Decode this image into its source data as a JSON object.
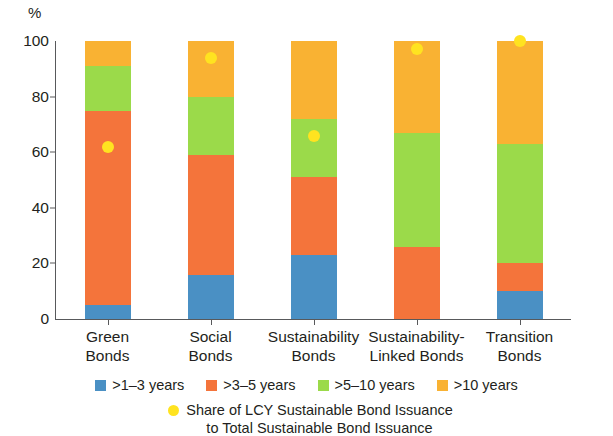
{
  "chart_data": {
    "type": "bar",
    "subtype": "stacked-bar-100-with-scatter-overlay",
    "title": "",
    "xlabel": "",
    "ylabel": "%",
    "ylim": [
      0,
      100
    ],
    "yticks": [
      0,
      20,
      40,
      60,
      80,
      100
    ],
    "ytick_labels": [
      "0",
      "20",
      "40",
      "60",
      "80",
      "100"
    ],
    "grid": false,
    "legend_position": "bottom",
    "categories": [
      "Green\nBonds",
      "Social\nBonds",
      "Sustainability\nBonds",
      "Sustainability-\nLinked Bonds",
      "Transition\nBonds"
    ],
    "category_names": [
      "Green Bonds",
      "Social Bonds",
      "Sustainability Bonds",
      "Sustainability-Linked Bonds",
      "Transition Bonds"
    ],
    "series": [
      {
        "name": ">1–3 years",
        "color": "#4a90c4",
        "values": [
          5,
          16,
          23,
          0,
          10
        ]
      },
      {
        "name": ">3–5 years",
        "color": "#f4743b",
        "values": [
          70,
          43,
          28,
          26,
          10
        ]
      },
      {
        "name": ">5–10 years",
        "color": "#9bda4a",
        "values": [
          16,
          21,
          21,
          41,
          43
        ]
      },
      {
        "name": ">10 years",
        "color": "#f9b233",
        "values": [
          9,
          20,
          28,
          33,
          37
        ]
      }
    ],
    "overlay": {
      "name": "Share of LCY Sustainable Bond Issuance\nto Total Sustainable Bond Issuance",
      "color": "#ffe320",
      "marker": "circle",
      "values": [
        62,
        94,
        66,
        97,
        100
      ]
    }
  },
  "axis": {
    "unit_label": "%"
  },
  "legend": {
    "entries": [
      {
        "label": ">1–3 years"
      },
      {
        "label": ">3–5 years"
      },
      {
        "label": ">5–10 years"
      },
      {
        "label": ">10 years"
      }
    ],
    "note": "Share of LCY Sustainable Bond Issuance\nto Total Sustainable Bond Issuance"
  }
}
